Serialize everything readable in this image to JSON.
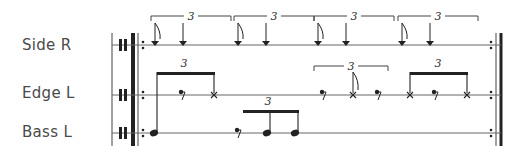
{
  "tracks": [
    {
      "label": "Side R"
    },
    {
      "label": "Edge L"
    },
    {
      "label": "Bass L"
    }
  ],
  "tuplet_number": "3",
  "colors": {
    "ink": "#222222",
    "staff": "#555555",
    "label": "#4a4a4a"
  },
  "notation": {
    "side_r": {
      "groups": [
        {
          "tuplet": "3",
          "notes": [
            "flag-arrow",
            "arrow"
          ]
        },
        {
          "tuplet": "3",
          "notes": [
            "flag-arrow",
            "arrow"
          ]
        },
        {
          "tuplet": "3",
          "notes": [
            "flag-arrow",
            "arrow"
          ]
        },
        {
          "tuplet": "3",
          "notes": [
            "flag-arrow",
            "arrow"
          ]
        }
      ]
    },
    "edge_l": {
      "groups": [
        {
          "tuplet": "3",
          "beamed": true,
          "notes": [
            "stem-from-beam",
            "dot-rest",
            "x"
          ]
        },
        {
          "tuplet": "3",
          "beamed": false,
          "notes": [
            "dot-rest",
            "flag-x",
            "dot-rest"
          ]
        },
        {
          "tuplet": "3",
          "beamed": true,
          "notes": [
            "x",
            "dot-rest",
            "x"
          ]
        }
      ]
    },
    "bass_l": {
      "groups": [
        {
          "notes": [
            "note"
          ]
        },
        {
          "tuplet": "3",
          "beamed": true,
          "notes": [
            "dot-rest",
            "note",
            "note"
          ]
        }
      ]
    }
  }
}
